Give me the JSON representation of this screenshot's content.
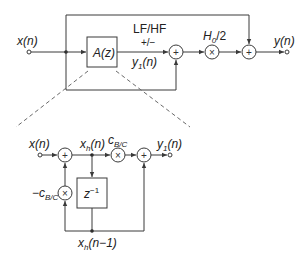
{
  "top_diagram": {
    "input_label": "x(n)",
    "output_label": "y(n)",
    "block_label": "A(z)",
    "mode_label": "LF/HF",
    "sign_label": "+/−",
    "allpass_output_label": "y1(n)",
    "gain_label": "H0/2",
    "sum_symbol": "+",
    "mult_symbol": "×"
  },
  "bottom_diagram": {
    "input_label": "x(n)",
    "state_label": "xh(n)",
    "coef_label": "cB/C",
    "neg_coef_label": "−cB/C",
    "delay_label": "z−1",
    "delayed_state_label": "xh(n−1)",
    "output_label": "y1(n)",
    "sum_symbol": "+",
    "mult_symbol": "×"
  },
  "colors": {
    "line": "#3a3a3a",
    "dashed": "#6a6a6a",
    "text": "#222222",
    "background": "#ffffff"
  }
}
